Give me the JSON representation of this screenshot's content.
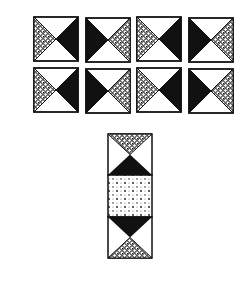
{
  "colors": {
    "background": "#ffffff",
    "ink": "#111111",
    "pattern_bg": "#ffffff"
  },
  "grid": {
    "tile_size": 46,
    "tiles": [
      {
        "row": 0,
        "col": 0,
        "x": 33,
        "y": 16,
        "left": "pattern",
        "right": "black"
      },
      {
        "row": 0,
        "col": 1,
        "x": 85,
        "y": 17,
        "left": "black",
        "right": "pattern"
      },
      {
        "row": 0,
        "col": 2,
        "x": 136,
        "y": 16,
        "left": "pattern",
        "right": "black"
      },
      {
        "row": 0,
        "col": 3,
        "x": 188,
        "y": 17,
        "left": "black",
        "right": "pattern"
      },
      {
        "row": 1,
        "col": 0,
        "x": 33,
        "y": 67,
        "left": "pattern",
        "right": "black"
      },
      {
        "row": 1,
        "col": 1,
        "x": 85,
        "y": 68,
        "left": "black",
        "right": "pattern"
      },
      {
        "row": 1,
        "col": 2,
        "x": 136,
        "y": 67,
        "left": "pattern",
        "right": "black"
      },
      {
        "row": 1,
        "col": 3,
        "x": 188,
        "y": 68,
        "left": "black",
        "right": "pattern"
      }
    ]
  },
  "column_block": {
    "x": 107,
    "y": 133,
    "width": 46,
    "height": 126,
    "sections": [
      {
        "name": "top",
        "top_triangle": "pattern",
        "bottom_triangle": "black"
      },
      {
        "name": "middle",
        "fill": "dotted"
      },
      {
        "name": "bottom",
        "top_triangle": "black",
        "bottom_triangle": "pattern"
      }
    ]
  }
}
